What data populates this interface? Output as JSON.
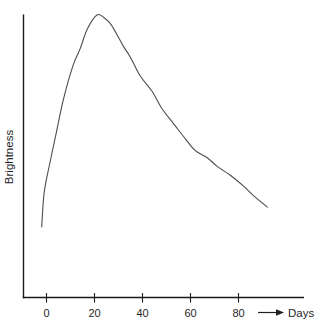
{
  "figure": {
    "ylabel": "Brightness",
    "xlabel": "Days",
    "x_tick_labels": [
      "0",
      "20",
      "40",
      "60",
      "80"
    ]
  },
  "chart_data": {
    "type": "line",
    "title": "",
    "xlabel": "Days",
    "ylabel": "Brightness",
    "x_ticks": [
      0,
      20,
      40,
      60,
      80
    ],
    "x_range_days": [
      -2,
      92
    ],
    "y_axis_numeric_labels": false,
    "grid": false,
    "legend": false,
    "line_color": "#4d4d4d",
    "peak": {
      "day": 21,
      "brightness_relative": 1.0
    },
    "series": [
      {
        "name": "brightness-light-curve",
        "x_days": [
          -2,
          -1,
          1,
          4,
          7,
          11,
          14,
          17,
          21,
          24,
          27,
          32,
          35,
          39,
          44,
          48,
          53,
          58,
          62,
          67,
          71,
          77,
          82,
          87,
          92
        ],
        "y_brightness_relative": [
          0.25,
          0.37,
          0.46,
          0.58,
          0.7,
          0.82,
          0.88,
          0.95,
          1.0,
          0.99,
          0.965,
          0.89,
          0.85,
          0.785,
          0.73,
          0.67,
          0.615,
          0.56,
          0.52,
          0.495,
          0.465,
          0.43,
          0.395,
          0.355,
          0.32
        ]
      }
    ]
  }
}
